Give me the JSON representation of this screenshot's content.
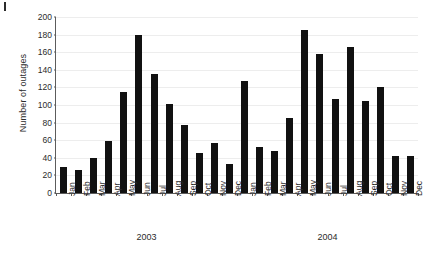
{
  "chart_data": {
    "type": "bar",
    "title": "",
    "subtitle": "",
    "xlabel": "",
    "ylabel": "Number of outages",
    "ylim": [
      0,
      200
    ],
    "yticks": [
      0,
      20,
      40,
      60,
      80,
      100,
      120,
      140,
      160,
      180,
      200
    ],
    "grid": true,
    "legend": null,
    "bar_color": "#111111",
    "axis_color": "#5c5c5c",
    "grid_color": "#ededed",
    "categories": [
      "Jan",
      "Feb",
      "Mar",
      "Apr",
      "May",
      "Jun",
      "Jul",
      "Aug",
      "Sep",
      "Oct",
      "Nov",
      "Dec",
      "Jan",
      "Feb",
      "Mar",
      "Apr",
      "May",
      "Jun",
      "Jul",
      "Aug",
      "Sep",
      "Oct",
      "Nov",
      "Dec"
    ],
    "values": [
      30,
      26,
      40,
      59,
      115,
      179,
      135,
      101,
      77,
      46,
      57,
      33,
      127,
      52,
      48,
      85,
      185,
      158,
      107,
      166,
      105,
      120,
      42,
      42
    ],
    "groups": [
      {
        "label": "2003",
        "start": 0,
        "end": 11
      },
      {
        "label": "2004",
        "start": 12,
        "end": 23
      }
    ]
  }
}
